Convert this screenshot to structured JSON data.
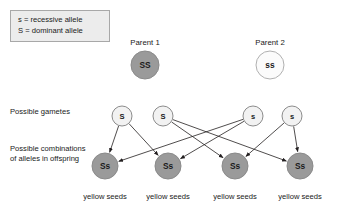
{
  "legend": {
    "lines": [
      "s = recessive allele",
      "S = dominant allele"
    ]
  },
  "row_labels": {
    "gametes": "Possible gametes",
    "combinations": "Possible combinations of alleles in offspring"
  },
  "parents": [
    {
      "title": "Parent 1",
      "genotype": "SS",
      "cx": 145,
      "cy": 65,
      "r": 14,
      "fill": "#9a9a9a",
      "stroke": "#8a8a8a",
      "title_y": 38
    },
    {
      "title": "Parent 2",
      "genotype": "ss",
      "cx": 270,
      "cy": 65,
      "r": 14,
      "fill": "#fbfbfb",
      "stroke": "#b0b0b0",
      "title_y": 38
    }
  ],
  "gametes": [
    {
      "allele": "S",
      "cx": 122,
      "cy": 116,
      "r": 10,
      "fill": "#f2f2f2",
      "stroke": "#8c8c8c"
    },
    {
      "allele": "S",
      "cx": 163,
      "cy": 116,
      "r": 10,
      "fill": "#f2f2f2",
      "stroke": "#8c8c8c"
    },
    {
      "allele": "s",
      "cx": 253,
      "cy": 116,
      "r": 10,
      "fill": "#f2f2f2",
      "stroke": "#8c8c8c"
    },
    {
      "allele": "s",
      "cx": 292,
      "cy": 116,
      "r": 10,
      "fill": "#f2f2f2",
      "stroke": "#8c8c8c"
    }
  ],
  "offspring": [
    {
      "genotype": "Ss",
      "caption": "yellow seeds",
      "cx": 105,
      "cy": 166,
      "r": 13,
      "fill": "#9a9a9a",
      "stroke": "#8a8a8a"
    },
    {
      "genotype": "Ss",
      "caption": "yellow seeds",
      "cx": 168,
      "cy": 166,
      "r": 13,
      "fill": "#9a9a9a",
      "stroke": "#8a8a8a"
    },
    {
      "genotype": "Ss",
      "caption": "yellow seeds",
      "cx": 235,
      "cy": 166,
      "r": 13,
      "fill": "#9a9a9a",
      "stroke": "#8a8a8a"
    },
    {
      "genotype": "Ss",
      "caption": "yellow seeds",
      "cx": 300,
      "cy": 166,
      "r": 13,
      "fill": "#9a9a9a",
      "stroke": "#8a8a8a"
    }
  ],
  "crosses": [
    {
      "from": 0,
      "to": 0
    },
    {
      "from": 0,
      "to": 1
    },
    {
      "from": 1,
      "to": 2
    },
    {
      "from": 1,
      "to": 3
    },
    {
      "from": 2,
      "to": 0
    },
    {
      "from": 2,
      "to": 1
    },
    {
      "from": 3,
      "to": 2
    },
    {
      "from": 3,
      "to": 3
    }
  ],
  "colors": {
    "arrow": "#231f20",
    "text": "#1a1a1a",
    "legend_fill": "#ececec",
    "legend_border": "#a8a8a8",
    "filled_circle": "#9a9a9a",
    "open_circle": "#fbfbfb",
    "gamete_circle": "#f2f2f2",
    "background": "#ffffff"
  }
}
